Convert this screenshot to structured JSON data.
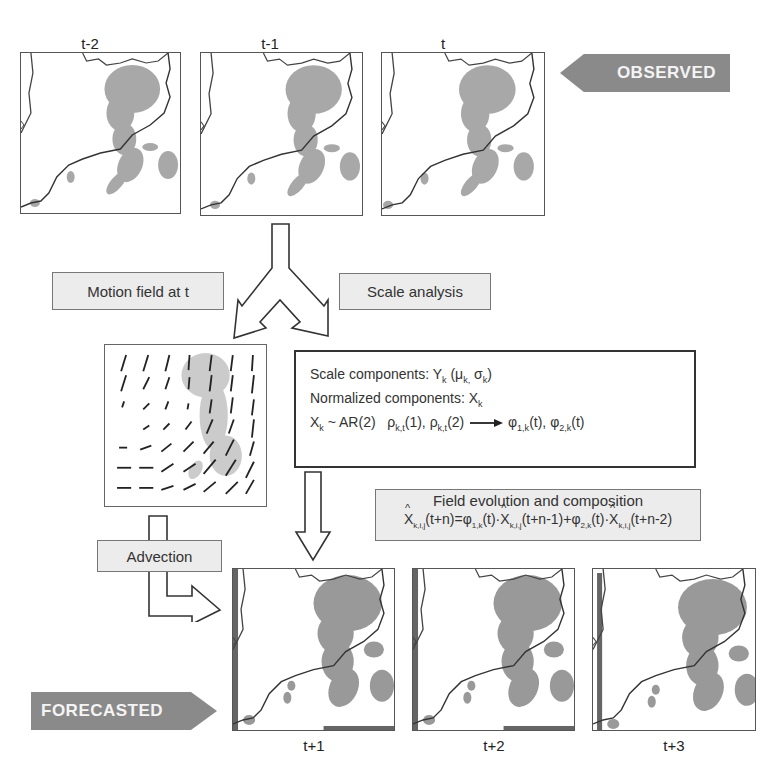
{
  "observed": {
    "tag_label": "OBSERVED",
    "maps": [
      {
        "label": "t-2"
      },
      {
        "label": "t-1"
      },
      {
        "label": "t"
      }
    ]
  },
  "forecasted": {
    "tag_label": "FORECASTED",
    "maps": [
      {
        "label": "t+1"
      },
      {
        "label": "t+2"
      },
      {
        "label": "t+3"
      }
    ]
  },
  "branches": {
    "motion_field_label": "Motion field at t",
    "scale_analysis_label": "Scale analysis",
    "advection_label": "Advection"
  },
  "model_box": {
    "line1_text": "Scale components: Y",
    "line1_sub": "k",
    "line1_params": "(μ",
    "line1_params_sub1": "k,",
    "line1_params_mid": " σ",
    "line1_params_sub2": "k",
    "line1_params_end": ")",
    "line2_text": "Normalized components: X",
    "line2_sub": "k",
    "line3_x": "X",
    "line3_x_sub": "k",
    "line3_ar": " ~ AR(2)",
    "line3_rho1": "ρ",
    "line3_rho1_sub": "k,t",
    "line3_rho1_arg": "(1), ",
    "line3_rho2": "ρ",
    "line3_rho2_sub": "k,t",
    "line3_rho2_arg": "(2)",
    "line3_phi1": "φ",
    "line3_phi1_sub": "1,k",
    "line3_phi1_arg": "(t), ",
    "line3_phi2": "φ",
    "line3_phi2_sub": "2,k",
    "line3_phi2_arg": "(t)"
  },
  "evolution_box": {
    "title": "Field evolution and composition",
    "x": "X",
    "x_sub": "k,i,j",
    "t1": "(t+n)=",
    "phi1": "φ",
    "phi1_sub": "1,k",
    "t2": "(t)·",
    "t3": "(t+n-1)+",
    "phi2": "φ",
    "phi2_sub": "2,k",
    "t4": "(t)·",
    "t5": "(t+n-2)"
  },
  "colors": {
    "tag_gray": "#8a8a8a",
    "box_fill": "#ececec",
    "rain_gray": "#9a9a9a"
  }
}
